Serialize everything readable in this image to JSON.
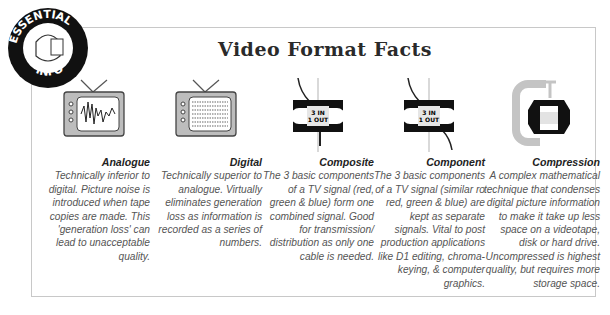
{
  "badge": {
    "top_text": "ESSENTIAL",
    "bottom_text": "INFO"
  },
  "title": "Video Format Facts",
  "cassette_label": {
    "line1": "3 IN",
    "line2": "1 OUT"
  },
  "columns": [
    {
      "heading": "Analogue",
      "icon": "tv-waveform-icon",
      "body": "Technically inferior to digital. Picture noise is introduced when tape copies are made. This 'generation loss' can lead to unacceptable quality."
    },
    {
      "heading": "Digital",
      "icon": "tv-digital-icon",
      "body": "Technically superior to analogue. Virtually eliminates generation loss as information is recorded as a series of numbers."
    },
    {
      "heading": "Composite",
      "icon": "cassette-composite-icon",
      "body": "The 3 basic components of a TV signal (red, green & blue) form one combined signal. Good for transmission/ distribution as only one cable is needed."
    },
    {
      "heading": "Component",
      "icon": "cassette-component-icon",
      "body": "The 3 basic components of a TV signal (similar ro red, green & blue) are kept as separate signals. Vital to post production applications like D1 editing, chroma-keying, & computer graphics."
    },
    {
      "heading": "Compression",
      "icon": "clamp-cassette-icon",
      "body": "A complex mathematical technique that condenses digital picture information to make it take up less space on a videotape, disk or hard drive. Uncompressed is highest quality, but requires more storage space."
    }
  ]
}
